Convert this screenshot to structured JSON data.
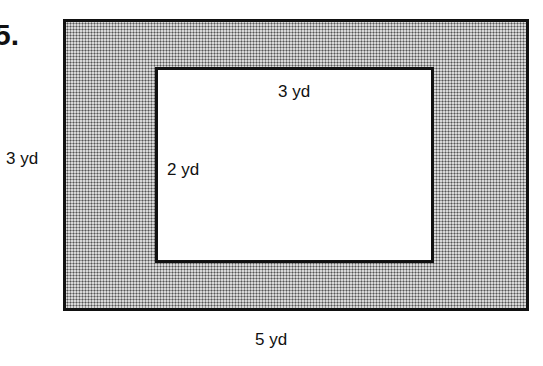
{
  "problem": {
    "number": "5."
  },
  "figure": {
    "outer_rectangle": {
      "width_label": "5 yd",
      "height_label": "3 yd",
      "fill": "dotted gray shading"
    },
    "inner_rectangle": {
      "width_label": "3 yd",
      "height_label": "2 yd",
      "fill": "#ffffff"
    },
    "colors": {
      "border": "#111111",
      "shading": "#d8d8d8"
    }
  }
}
